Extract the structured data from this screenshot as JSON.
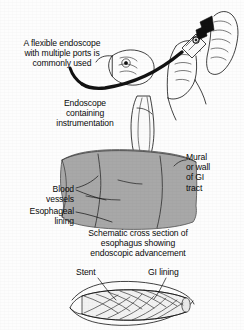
{
  "figure": {
    "background_color": "#fdfdfd",
    "ink_color": "#0a0a0a",
    "tissue_color": "#a8a8a8",
    "tissue_edge_color": "#6f6f6f",
    "scope_fill_color": "#fbfbfb",
    "stent_fill_color": "#f2f2f2"
  },
  "labels": {
    "intro": "A flexible endoscope\nwith multiple ports is\ncommonly used",
    "endoscope": "Endoscope\ncontaining\ninstrumentation",
    "mural": "Mural\nor wall\nof GI\ntract",
    "blood_vessels": "Blood\nvessels",
    "esophageal_lining": "Esophageal\nlining",
    "caption": "Schematic cross section of\nesophagus showing\nendoscopic advancement",
    "stent": "Stent",
    "gi_lining": "GI lining"
  },
  "panels": [
    {
      "name": "hands-holding-endoscope",
      "label_key": "intro"
    },
    {
      "name": "esophagus-cross-section",
      "label_key": "caption"
    },
    {
      "name": "stent-in-gi-lining",
      "label_key": "stent"
    }
  ]
}
